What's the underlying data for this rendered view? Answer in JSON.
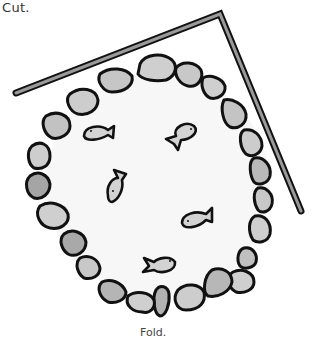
{
  "captions": {
    "top": "Cut.",
    "bottom": "Fold."
  },
  "colors": {
    "background": "#ffffff",
    "outline": "#111111",
    "bar_fill": "#9a9a9a",
    "pond_fill": "#f7f7f7",
    "stone_light": "#cfcfcf",
    "stone_dark": "#a8a8a8",
    "fish_fill": "#d3d3d3"
  },
  "illustration": {
    "subject": "round pond with stone border and five fish, angled bar at top-right",
    "fish_count": 5
  }
}
